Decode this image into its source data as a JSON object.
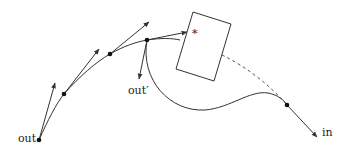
{
  "diagram": {
    "labels": {
      "out": "out",
      "out_prime": "out′",
      "in": "in",
      "star": "*"
    },
    "colors": {
      "stroke": "#333333",
      "dashed": "#555555",
      "background": "#ffffff"
    },
    "nodes": [
      {
        "id": "out",
        "x": 39,
        "y": 140
      },
      {
        "id": "p2",
        "x": 64,
        "y": 94
      },
      {
        "id": "p3",
        "x": 110,
        "y": 54
      },
      {
        "id": "p4",
        "x": 147,
        "y": 40
      },
      {
        "id": "in-node",
        "x": 287,
        "y": 105
      }
    ],
    "obstacle": {
      "shape": "rotated-rectangle",
      "corners": [
        [
          193,
          12
        ],
        [
          231,
          24
        ],
        [
          214,
          81
        ],
        [
          176,
          69
        ]
      ]
    }
  }
}
